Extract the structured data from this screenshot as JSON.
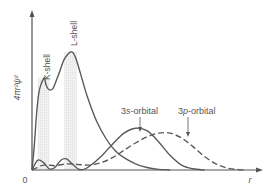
{
  "chart_data": {
    "type": "line",
    "title": "",
    "xlabel": "r",
    "ylabel": "4πr²ψ²",
    "origin_label": "0",
    "xlim": [
      0,
      10
    ],
    "ylim": [
      0,
      10
    ],
    "grid": false,
    "legend": "none",
    "shells": [
      {
        "name": "K-shell",
        "label": "K-shell",
        "x_range": [
          0.25,
          0.75
        ],
        "peak_x": 0.55,
        "peak_y": 7.5
      },
      {
        "name": "L-shell",
        "label": "L-shell",
        "x_range": [
          1.4,
          1.95
        ],
        "peak_x": 1.75,
        "peak_y": 9.6
      }
    ],
    "series": [
      {
        "name": "Total (K + L shells)",
        "style": "solid",
        "x": [
          0,
          0.1,
          0.2,
          0.3,
          0.4,
          0.5,
          0.55,
          0.6,
          0.7,
          0.8,
          0.9,
          1.0,
          1.2,
          1.4,
          1.6,
          1.75,
          1.9,
          2.1,
          2.4,
          2.8,
          3.2,
          3.6,
          4.0,
          4.5,
          5.0,
          5.5,
          6.0
        ],
        "y": [
          0,
          2.0,
          4.6,
          6.3,
          7.0,
          7.4,
          7.5,
          7.0,
          6.6,
          6.5,
          6.6,
          7.0,
          8.0,
          9.0,
          9.5,
          9.6,
          9.1,
          7.9,
          6.0,
          4.0,
          2.6,
          1.6,
          1.0,
          0.5,
          0.2,
          0.05,
          0
        ]
      },
      {
        "name": "3s-orbital",
        "label": "3s-orbital",
        "style": "solid",
        "x": [
          0,
          0.25,
          0.5,
          0.75,
          1.0,
          1.25,
          1.5,
          1.75,
          2.0,
          2.25,
          2.5,
          3.0,
          3.5,
          4.0,
          4.5,
          5.0,
          5.5,
          6.0,
          6.5,
          7.0,
          7.5
        ],
        "y": [
          0,
          0.8,
          0.6,
          0.1,
          0.2,
          0.8,
          0.9,
          0.5,
          0.1,
          0.05,
          0.3,
          1.1,
          2.1,
          3.0,
          3.4,
          3.2,
          2.3,
          1.2,
          0.4,
          0.1,
          0
        ]
      },
      {
        "name": "3p-orbital",
        "label": "3p-orbital",
        "style": "dashed",
        "x": [
          0,
          0.5,
          1.0,
          1.5,
          2.0,
          2.5,
          3.0,
          3.5,
          4.0,
          4.5,
          5.0,
          5.5,
          6.0,
          6.5,
          7.0,
          7.5,
          8.0,
          8.5,
          9.0,
          9.3
        ],
        "y": [
          0,
          0.4,
          0.35,
          0.5,
          0.45,
          0.4,
          0.6,
          1.0,
          1.6,
          2.2,
          2.7,
          3.0,
          3.0,
          2.6,
          1.9,
          1.1,
          0.5,
          0.15,
          0.03,
          0
        ]
      }
    ],
    "annotations": [
      {
        "text": "K-shell",
        "orientation": "vertical",
        "target": "K-shell peak"
      },
      {
        "text": "L-shell",
        "orientation": "vertical",
        "target": "L-shell peak"
      },
      {
        "text": "3s-orbital",
        "arrow_to": "3s-orbital peak"
      },
      {
        "text": "3p-orbital",
        "arrow_to": "3p-orbital peak"
      }
    ]
  },
  "labels": {
    "ylabel": "4πr²ψ²",
    "xlabel": "r",
    "origin": "0",
    "k_shell": "K-shell",
    "l_shell": "L-shell",
    "s3_prefix": "3",
    "s3_italic": "s",
    "s3_suffix": "-orbital",
    "p3_prefix": "3",
    "p3_italic": "p",
    "p3_suffix": "-orbital"
  }
}
